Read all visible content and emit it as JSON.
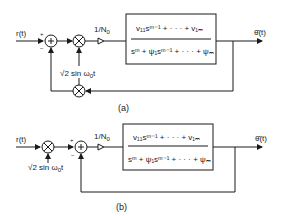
{
  "diagrams": [
    {
      "id": "a",
      "caption": "(a)",
      "input_label": "r(t)",
      "output_label": "θ̂(t)",
      "gain_label": "1/N",
      "gain_sub": "0",
      "mixer_label": "√2 sin ω",
      "mixer_sub": "0",
      "mixer_t": "t",
      "summer_signs": {
        "top": "+",
        "bottom": "−"
      },
      "transfer_function": {
        "numerator": "v₁₁sᵐ⁻¹ + · · · + v₁ₘ",
        "denominator": "sᵐ + ψ₁sᵐ⁻¹ + · · · + ψₘ"
      }
    },
    {
      "id": "b",
      "caption": "(b)",
      "input_label": "r(t)",
      "output_label": "θ̂(t)",
      "gain_label": "1/N",
      "gain_sub": "0",
      "mixer_label": "√2 sin ω",
      "mixer_sub": "0",
      "mixer_t": "t",
      "summer_signs": {
        "top": "+",
        "bottom": "−"
      },
      "transfer_function": {
        "numerator": "v₁₁sᵐ⁻¹ + · · · + v₁ₘ",
        "denominator": "sᵐ + ψ₁sᵐ⁻¹ + · · · + ψₘ"
      }
    }
  ],
  "colors": {
    "ink": "#1a1a1a",
    "background": "#ffffff"
  }
}
